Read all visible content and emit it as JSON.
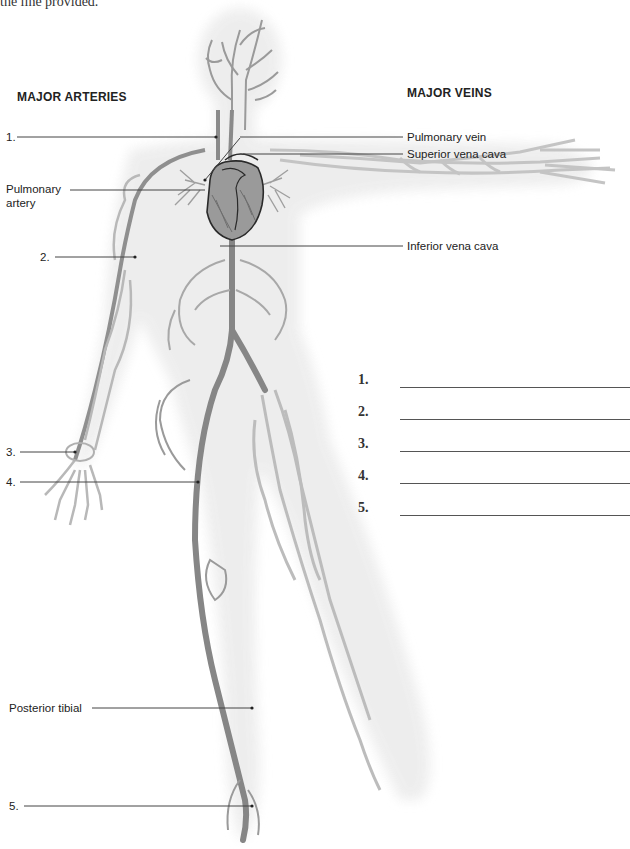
{
  "intro_text": "the line provided.",
  "headings": {
    "arteries": "MAJOR ARTERIES",
    "veins": "MAJOR VEINS"
  },
  "artery_labels": [
    {
      "id": "1",
      "text": "1."
    },
    {
      "id": "pulmonary-artery",
      "text": "Pulmonary",
      "text2": "artery"
    },
    {
      "id": "2",
      "text": "2."
    },
    {
      "id": "3",
      "text": "3."
    },
    {
      "id": "4",
      "text": "4."
    },
    {
      "id": "posterior-tibial",
      "text": "Posterior tibial"
    },
    {
      "id": "5",
      "text": "5."
    }
  ],
  "vein_labels": [
    {
      "id": "pulmonary-vein",
      "text": "Pulmonary vein"
    },
    {
      "id": "superior-vena-cava",
      "text": "Superior vena cava"
    },
    {
      "id": "inferior-vena-cava",
      "text": "Inferior vena cava"
    }
  ],
  "answer_blanks": [
    {
      "number": "1.",
      "value": ""
    },
    {
      "number": "2.",
      "value": ""
    },
    {
      "number": "3.",
      "value": ""
    },
    {
      "number": "4.",
      "value": ""
    },
    {
      "number": "5.",
      "value": ""
    }
  ],
  "colors": {
    "artery": "#8a8a8a",
    "vein": "#b9b9b9",
    "body_shade": "#ececec",
    "leader_line": "#444444",
    "heart_outline": "#2a2a2a"
  }
}
